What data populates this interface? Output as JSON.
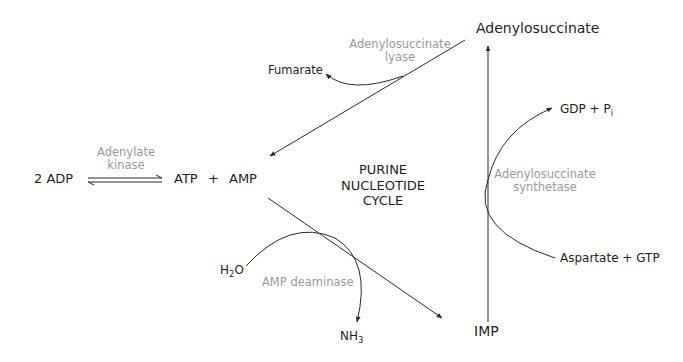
{
  "title": {
    "line1": "PURINE",
    "line2": "NUCLEOTIDE",
    "line3": "CYCLE"
  },
  "metabolites": {
    "adp": "2 ADP",
    "atp": "ATP",
    "plus1": "+",
    "amp": "AMP",
    "adenylosuccinate": "Adenylosuccinate",
    "fumarate": "Fumarate",
    "gdp": "GDP + P",
    "gdp_sub": "i",
    "aspartate_gtp": "Aspartate + GTP",
    "imp": "IMP",
    "h2o_h": "H",
    "h2o_sub": "2",
    "h2o_o": "O",
    "nh3_nh": "NH",
    "nh3_sub": "3"
  },
  "enzymes": {
    "adenylate_kinase_l1": "Adenylate",
    "adenylate_kinase_l2": "kinase",
    "lyase_l1": "Adenylosuccinate",
    "lyase_l2": "lyase",
    "synthetase_l1": "Adenylosuccinate",
    "synthetase_l2": "synthetase",
    "deaminase": "AMP deaminase"
  },
  "colors": {
    "line": "#2b2b2b",
    "metabolite_text": "#1e1e1e",
    "enzyme_text": "#9a9a9a",
    "background": "#ffffff"
  }
}
